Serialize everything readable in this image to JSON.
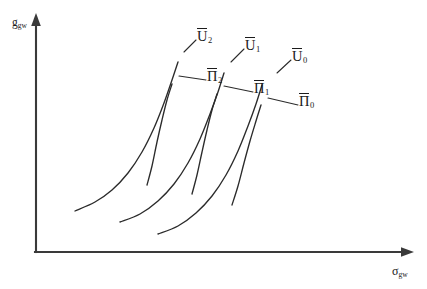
{
  "figure": {
    "type": "diagram",
    "background_color": "#ffffff",
    "line_color": "#2b2b2b",
    "axis_color": "#3a3a3a",
    "width": 427,
    "height": 289
  },
  "axes": {
    "y": {
      "label_symbol": "g",
      "label_subscript": "gw",
      "name": "y-axis",
      "arrow": "up-arrow-icon"
    },
    "x": {
      "label_symbol": "σ",
      "label_subscript": "gw",
      "name": "x-axis",
      "arrow": "right-arrow-icon"
    }
  },
  "chart_data": {
    "type": "line",
    "title": "",
    "xlabel": "σ_gw",
    "ylabel": "g_gw",
    "grid": false,
    "legend": "inline-curve-labels",
    "series": [
      {
        "name": "U2",
        "display": "U̅2",
        "family": "utility",
        "points": [
          [
            75,
            211
          ],
          [
            95,
            202
          ],
          [
            112,
            190
          ],
          [
            128,
            173
          ],
          [
            142,
            152
          ],
          [
            154,
            128
          ],
          [
            164,
            103
          ],
          [
            172,
            80
          ],
          [
            178,
            62
          ]
        ]
      },
      {
        "name": "Pi2",
        "display": "Π̅2",
        "family": "isoprofit",
        "points": [
          [
            147,
            185
          ],
          [
            152,
            166
          ],
          [
            157,
            142
          ],
          [
            162,
            120
          ],
          [
            167,
            100
          ],
          [
            172,
            84
          ]
        ]
      },
      {
        "name": "U1",
        "display": "U̅1",
        "family": "utility",
        "points": [
          [
            120,
            222
          ],
          [
            140,
            214
          ],
          [
            158,
            201
          ],
          [
            174,
            184
          ],
          [
            188,
            163
          ],
          [
            200,
            139
          ],
          [
            210,
            114
          ],
          [
            218,
            92
          ],
          [
            224,
            73
          ]
        ]
      },
      {
        "name": "Pi1",
        "display": "Π̅1",
        "family": "isoprofit",
        "points": [
          [
            192,
            194
          ],
          [
            197,
            175
          ],
          [
            202,
            152
          ],
          [
            207,
            130
          ],
          [
            212,
            110
          ],
          [
            217,
            94
          ]
        ]
      },
      {
        "name": "U0",
        "display": "U̅0",
        "family": "utility",
        "points": [
          [
            158,
            234
          ],
          [
            178,
            226
          ],
          [
            196,
            213
          ],
          [
            212,
            196
          ],
          [
            226,
            175
          ],
          [
            238,
            151
          ],
          [
            248,
            126
          ],
          [
            256,
            104
          ],
          [
            262,
            85
          ]
        ]
      },
      {
        "name": "Pi0",
        "display": "Π̅0",
        "family": "isoprofit",
        "points": [
          [
            232,
            205
          ],
          [
            238,
            186
          ],
          [
            244,
            163
          ],
          [
            250,
            141
          ],
          [
            256,
            121
          ],
          [
            261,
            105
          ]
        ]
      }
    ],
    "annotations": [
      {
        "name": "U2",
        "text_symbol": "U",
        "text_subscript": "2",
        "overbar": true,
        "x": 197,
        "y": 28
      },
      {
        "name": "U1",
        "text_symbol": "U",
        "text_subscript": "1",
        "overbar": true,
        "x": 245,
        "y": 37
      },
      {
        "name": "U0",
        "text_symbol": "U",
        "text_subscript": "0",
        "overbar": true,
        "x": 292,
        "y": 48
      },
      {
        "name": "Pi2",
        "text_symbol": "Π",
        "text_subscript": "2",
        "overbar": true,
        "x": 207,
        "y": 68
      },
      {
        "name": "Pi1",
        "text_symbol": "Π",
        "text_subscript": "1",
        "overbar": true,
        "x": 254,
        "y": 80
      },
      {
        "name": "Pi0",
        "text_symbol": "Π",
        "text_subscript": "0",
        "overbar": true,
        "x": 299,
        "y": 93
      }
    ]
  },
  "leaders": [
    {
      "name": "leader-u2",
      "from": [
        196,
        40
      ],
      "to": [
        184,
        52
      ]
    },
    {
      "name": "leader-u1",
      "from": [
        244,
        49
      ],
      "to": [
        231,
        62
      ]
    },
    {
      "name": "leader-u0",
      "from": [
        291,
        60
      ],
      "to": [
        277,
        73
      ]
    },
    {
      "name": "leader-pi2",
      "from": [
        206,
        80
      ],
      "to": [
        179,
        76
      ]
    },
    {
      "name": "leader-pi1",
      "from": [
        253,
        92
      ],
      "to": [
        224,
        86
      ]
    },
    {
      "name": "leader-pi0",
      "from": [
        298,
        105
      ],
      "to": [
        268,
        98
      ]
    }
  ]
}
